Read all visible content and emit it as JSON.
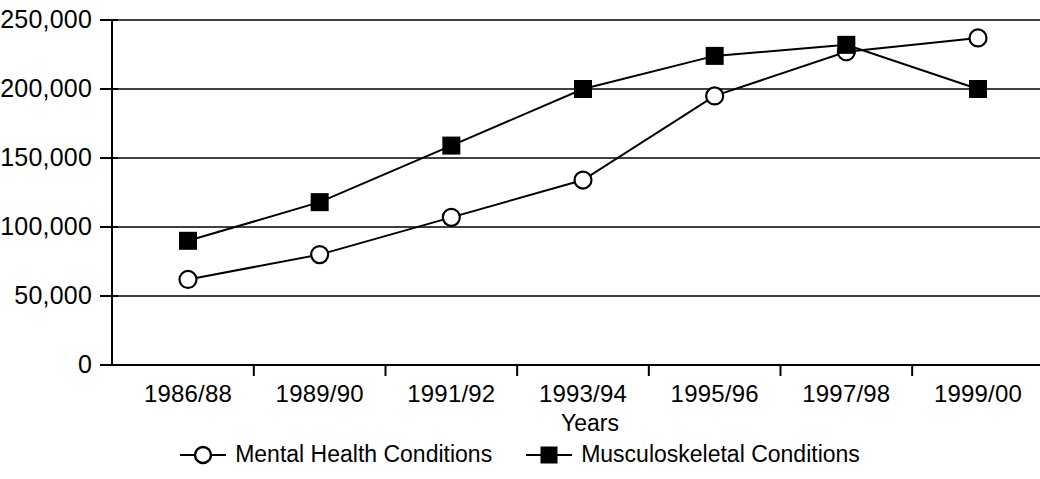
{
  "chart_data": {
    "type": "line",
    "title": "",
    "xlabel": "Years",
    "ylabel": "",
    "categories": [
      "1986/88",
      "1989/90",
      "1991/92",
      "1993/94",
      "1995/96",
      "1997/98",
      "1999/00"
    ],
    "ylim": [
      0,
      250000
    ],
    "ytick_values": [
      0,
      50000,
      100000,
      150000,
      200000,
      250000
    ],
    "ytick_labels": [
      "0",
      "50,000",
      "100,000",
      "150,000",
      "200,000",
      "250,000"
    ],
    "grid": "horizontal",
    "legend_position": "bottom-center",
    "series": [
      {
        "name": "Mental Health Conditions",
        "marker": "open-circle",
        "values": [
          62000,
          80000,
          107000,
          134000,
          195000,
          227000,
          237000
        ]
      },
      {
        "name": "Musculoskeletal Conditions",
        "marker": "filled-square",
        "values": [
          90000,
          118000,
          159000,
          200000,
          224000,
          232000,
          200000
        ]
      }
    ]
  },
  "legend": {
    "entries": [
      {
        "label": "Mental Health Conditions",
        "marker": "open-circle-marker"
      },
      {
        "label": "Musculoskeletal Conditions",
        "marker": "filled-square-marker"
      }
    ]
  },
  "colors": {
    "line": "#000000",
    "grid": "#000000",
    "axis": "#000000",
    "background": "#ffffff",
    "marker_fill_open": "#ffffff",
    "marker_fill_solid": "#000000"
  },
  "axis_title": {
    "x": "Years"
  }
}
